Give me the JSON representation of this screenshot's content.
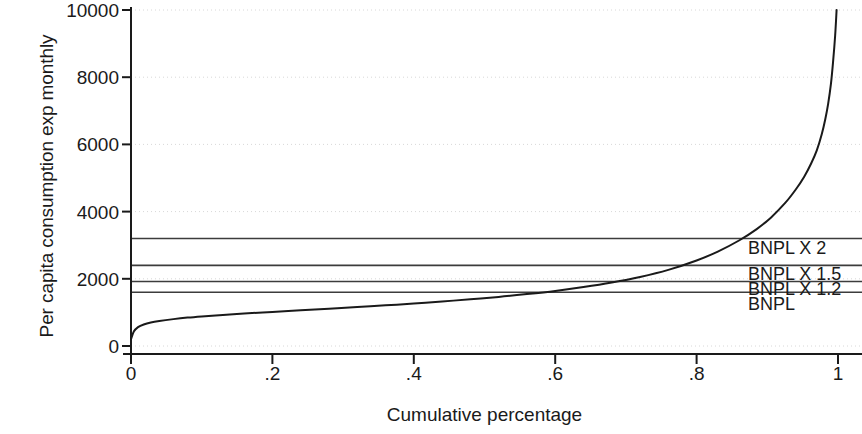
{
  "chart_data": {
    "type": "line",
    "title": "",
    "subtitle": "",
    "xlabel": "Cumulative percentage",
    "ylabel": "Per capita consumption exp monthly",
    "xlim": [
      0,
      1
    ],
    "ylim": [
      0,
      10000
    ],
    "xticks": [
      "0",
      ".2",
      ".4",
      ".6",
      ".8",
      "1"
    ],
    "xtick_values": [
      0,
      0.2,
      0.4,
      0.6,
      0.8,
      1
    ],
    "yticks": [
      "0",
      "2000",
      "4000",
      "6000",
      "8000",
      "10000"
    ],
    "ytick_values": [
      0,
      2000,
      4000,
      6000,
      8000,
      10000
    ],
    "grid": "horizontal-dotted",
    "legend": "none",
    "series": [
      {
        "name": "Per capita consumption exp monthly",
        "color": "#1a1a1a",
        "x": [
          0.0,
          0.004,
          0.01,
          0.018,
          0.028,
          0.04,
          0.06,
          0.08,
          0.1,
          0.13,
          0.16,
          0.2,
          0.24,
          0.28,
          0.32,
          0.36,
          0.4,
          0.44,
          0.48,
          0.52,
          0.56,
          0.6,
          0.64,
          0.68,
          0.72,
          0.76,
          0.8,
          0.83,
          0.86,
          0.885,
          0.905,
          0.925,
          0.94,
          0.952,
          0.962,
          0.97,
          0.977,
          0.982,
          0.986,
          0.99,
          0.993,
          0.996,
          0.998
        ],
        "y": [
          200,
          430,
          560,
          640,
          700,
          745,
          800,
          845,
          880,
          925,
          965,
          1015,
          1065,
          1110,
          1160,
          1210,
          1265,
          1325,
          1390,
          1460,
          1545,
          1640,
          1755,
          1890,
          2055,
          2265,
          2545,
          2810,
          3140,
          3480,
          3820,
          4250,
          4650,
          5030,
          5430,
          5820,
          6300,
          6750,
          7200,
          7800,
          8450,
          9250,
          10000
        ]
      }
    ],
    "reference_lines": [
      {
        "label": "BNPL X 2",
        "value": 3200,
        "color": "#3c3c3c"
      },
      {
        "label": "BNPL X 1.5",
        "value": 2400,
        "color": "#3c3c3c"
      },
      {
        "label": "BNPL X 1.2",
        "value": 1920,
        "color": "#3c3c3c"
      },
      {
        "label": "BNPL",
        "value": 1600,
        "color": "#3c3c3c"
      }
    ],
    "reference_label_positions": [
      {
        "label": "BNPL X 2",
        "y_value": 2920
      },
      {
        "label": "BNPL X 1.5",
        "y_value": 2140
      },
      {
        "label": "BNPL X 1.2",
        "y_value": 1700
      },
      {
        "label": "BNPL",
        "y_value": 1240
      }
    ]
  }
}
